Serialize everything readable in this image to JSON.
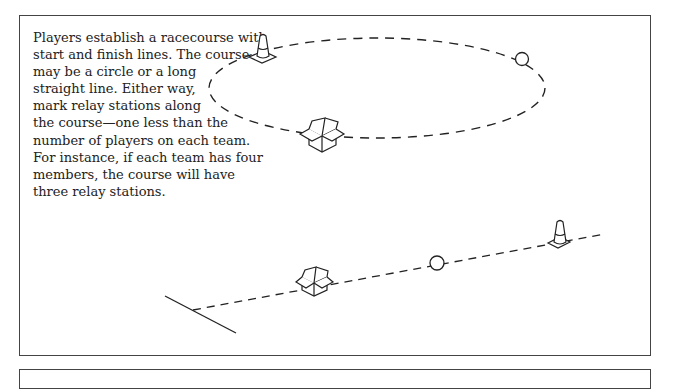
{
  "instructions": {
    "lines": [
      "Players establish a racecourse with",
      "start and finish lines. The course",
      "may be a circle or a long",
      "straight line. Either way,",
      "mark relay stations along",
      "the course—one less than the",
      "number of players on each team.",
      "For instance, if each team has four",
      "members, the course will have",
      "three relay stations."
    ]
  },
  "illustrations": {
    "circular_course": {
      "markers": [
        "traffic-cone",
        "ball",
        "box"
      ]
    },
    "straight_course": {
      "markers": [
        "start-line",
        "box",
        "ball",
        "traffic-cone"
      ]
    }
  }
}
